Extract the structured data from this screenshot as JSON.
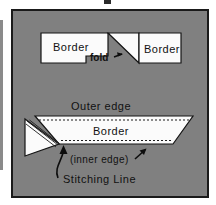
{
  "figure": {
    "background_color": "#808080",
    "frame_color": "#1a1a1a",
    "piece_color": "#fbfbfb",
    "line_color": "#141414"
  },
  "top_section": {
    "left_piece_label": "Border",
    "right_piece_label": "Border",
    "fold_label": "fold"
  },
  "bottom_section": {
    "outer_edge_label": "Outer edge",
    "border_label": "Border",
    "inner_edge_label": "(inner edge)",
    "stitching_line_label": "Stitching Line"
  }
}
